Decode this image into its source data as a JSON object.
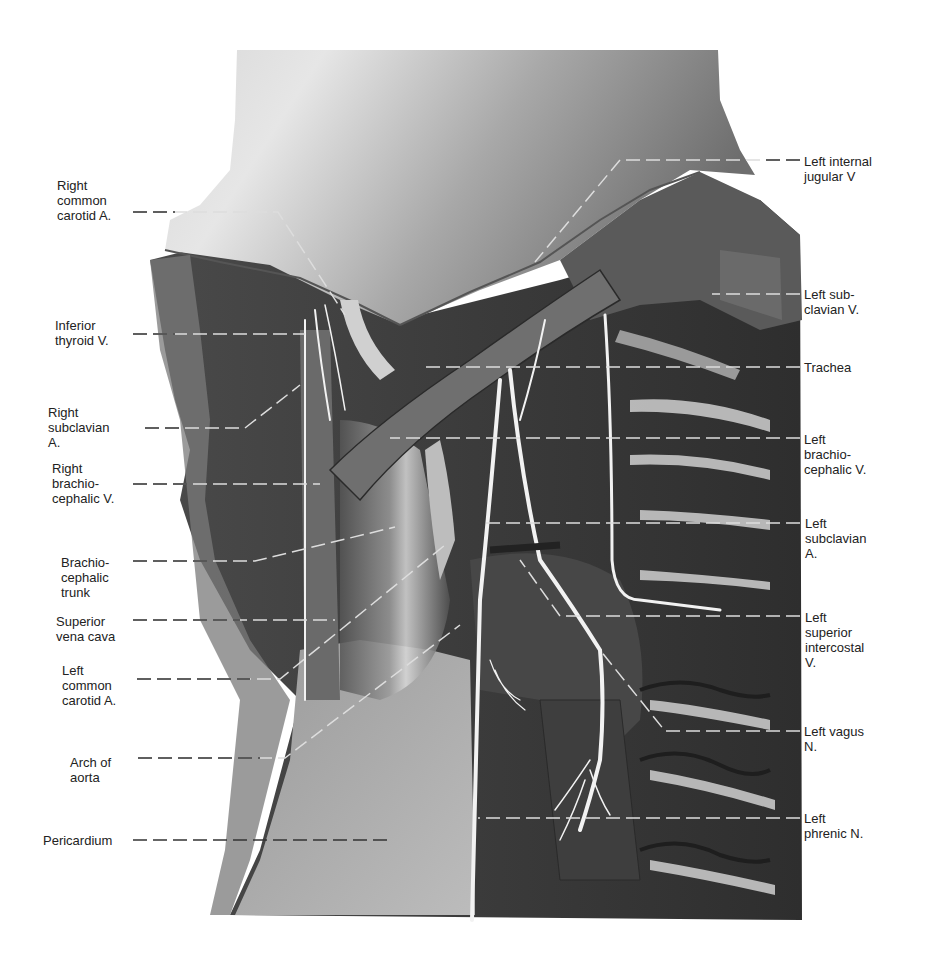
{
  "figure": {
    "colors": {
      "background": "#ffffff",
      "label_text": "#222222",
      "leader_line_on_white": "#333333",
      "leader_line_on_specimen": "#e8e8e8",
      "skin_light": "#b8b8b8",
      "tissue_dark": "#3a3a3a",
      "vessel_highlight": "#f0f0f0"
    }
  },
  "labels": {
    "left": [
      {
        "id": "right-common-carotid-a",
        "text": "Right\ncommon\ncarotid A."
      },
      {
        "id": "inferior-thyroid-v",
        "text": "Inferior\nthyroid V."
      },
      {
        "id": "right-subclavian-a",
        "text": "Right\nsubclavian\nA."
      },
      {
        "id": "right-brachiocephalic-v",
        "text": "Right\nbrachio-\ncephalic V."
      },
      {
        "id": "brachiocephalic-trunk",
        "text": "Brachio-\ncephalic\ntrunk"
      },
      {
        "id": "superior-vena-cava",
        "text": "Superior\nvena cava"
      },
      {
        "id": "left-common-carotid-a",
        "text": "Left\ncommon\ncarotid A."
      },
      {
        "id": "arch-of-aorta",
        "text": "Arch of\naorta"
      },
      {
        "id": "pericardium",
        "text": "Pericardium"
      }
    ],
    "right": [
      {
        "id": "left-internal-jugular-v",
        "text": "Left internal\njugular V"
      },
      {
        "id": "left-subclavian-v",
        "text": "Left sub-\nclavian V."
      },
      {
        "id": "trachea",
        "text": "Trachea"
      },
      {
        "id": "left-brachiocephalic-v",
        "text": "Left\nbrachio-\ncephalic V."
      },
      {
        "id": "left-subclavian-a",
        "text": "Left\nsubclavian\nA."
      },
      {
        "id": "left-superior-intercostal-v",
        "text": "Left\nsuperior\nintercostal\nV."
      },
      {
        "id": "left-vagus-n",
        "text": "Left vagus\nN."
      },
      {
        "id": "left-phrenic-n",
        "text": "Left\nphrenic N."
      }
    ]
  }
}
